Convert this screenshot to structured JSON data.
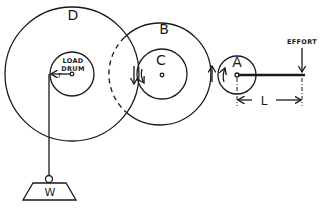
{
  "diagram": {
    "type": "gear-train winch",
    "labels": {
      "gear_d": "D",
      "gear_b": "B",
      "gear_c": "C",
      "gear_a": "A",
      "load_drum_line1": "LOAD",
      "load_drum_line2": "DRUM",
      "drum_radius": "r",
      "effort": "EFFORT",
      "lever_length": "L",
      "load": "W"
    },
    "colors": {
      "ink": "#1a1a1a",
      "background": "#ffffff"
    }
  }
}
